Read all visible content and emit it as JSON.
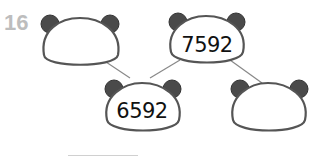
{
  "question_number": "16",
  "tree": {
    "nodes": [
      {
        "id": "top-left",
        "value": ""
      },
      {
        "id": "top-middle",
        "value": "7592"
      },
      {
        "id": "bottom-left",
        "value": "6592"
      },
      {
        "id": "bottom-right",
        "value": ""
      }
    ],
    "edges": [
      [
        "top-left",
        "bottom-left"
      ],
      [
        "top-middle",
        "bottom-left"
      ],
      [
        "top-middle",
        "bottom-right"
      ]
    ]
  },
  "colors": {
    "outline": "#555555",
    "ear": "#4a4a4a",
    "line": "#888888",
    "qnum": "#bdbdbd"
  }
}
